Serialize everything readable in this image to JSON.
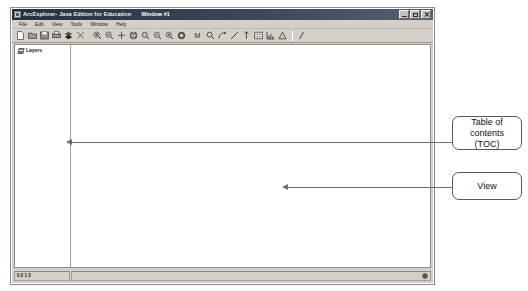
{
  "window": {
    "app_title": "ArcExplorer- Java Edition for Education",
    "document_title": "Window #1",
    "icon": "app-icon",
    "controls": [
      {
        "name": "minimize",
        "label": "minimize-icon"
      },
      {
        "name": "maximize",
        "label": "maximize-icon"
      },
      {
        "name": "close",
        "label": "close-icon"
      }
    ]
  },
  "menu": {
    "items": [
      {
        "label": "File"
      },
      {
        "label": "Edit"
      },
      {
        "label": "View"
      },
      {
        "label": "Tools"
      },
      {
        "label": "Window"
      },
      {
        "label": "Help"
      }
    ]
  },
  "toolbar": {
    "groups": [
      {
        "name": "file-group",
        "buttons": [
          {
            "icon": "new-document-icon"
          },
          {
            "icon": "open-folder-icon"
          },
          {
            "icon": "save-icon"
          },
          {
            "icon": "print-icon"
          },
          {
            "icon": "add-layer-icon"
          },
          {
            "icon": "cut-icon"
          }
        ]
      },
      {
        "name": "navigation-group",
        "buttons": [
          {
            "icon": "zoom-in-icon"
          },
          {
            "icon": "zoom-out-icon"
          },
          {
            "icon": "pan-icon"
          },
          {
            "icon": "globe-icon"
          },
          {
            "icon": "zoom-to-layer-icon"
          },
          {
            "icon": "zoom-previous-icon"
          },
          {
            "icon": "zoom-next-icon"
          },
          {
            "icon": "full-extent-icon"
          }
        ]
      },
      {
        "name": "tools-group",
        "buttons": [
          {
            "icon": "identify-icon"
          },
          {
            "icon": "find-icon"
          },
          {
            "icon": "query-icon"
          },
          {
            "icon": "measure-icon"
          },
          {
            "icon": "hotlink-icon"
          },
          {
            "icon": "table-icon"
          },
          {
            "icon": "chart-icon"
          },
          {
            "icon": "legend-icon"
          }
        ]
      },
      {
        "name": "help-group",
        "buttons": [
          {
            "icon": "help-pointer-icon"
          }
        ]
      }
    ]
  },
  "toc": {
    "label": "Layers",
    "icon": "layers-icon"
  },
  "view": {
    "content": ""
  },
  "status": {
    "left_text": "0.0 1 0",
    "indicator": "status-indicator"
  },
  "annotations": [
    {
      "name": "toc-callout",
      "text": "Table of contents (TOC)",
      "line1": "Table of",
      "line2": "contents (TOC)"
    },
    {
      "name": "view-callout",
      "text": "View"
    }
  ],
  "colors": {
    "window_chrome": "#d4d0c8",
    "title_bar": "#3b4656",
    "client_background": "#ffffff",
    "border": "#8d8d8d",
    "annotation_border": "#595959",
    "leader_line": "#6e6e6e"
  }
}
